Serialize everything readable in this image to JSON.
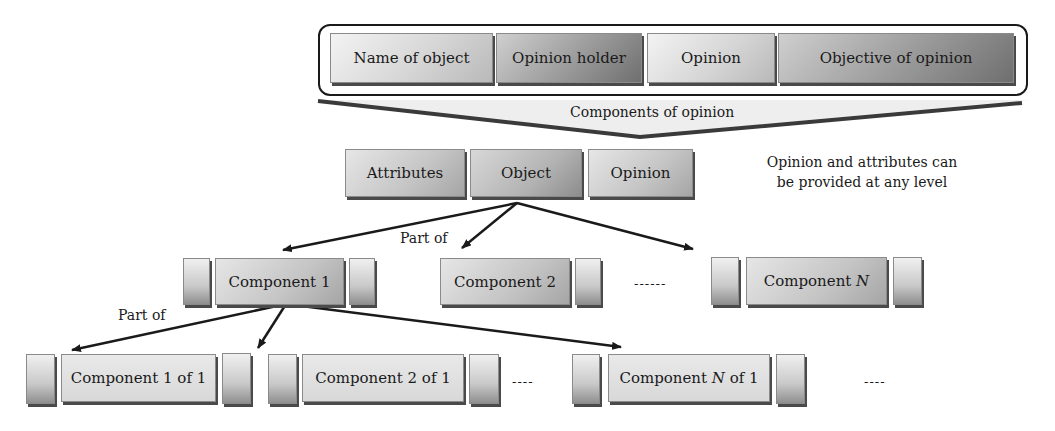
{
  "components_of_opinion": {
    "items": [
      {
        "label": "Name of object",
        "style": "light"
      },
      {
        "label": "Opinion holder",
        "style": "dark"
      },
      {
        "label": "Opinion",
        "style": "light"
      },
      {
        "label": "Objective of opinion",
        "style": "dark"
      }
    ],
    "caption": "Components of opinion"
  },
  "object_level": {
    "items": [
      "Attributes",
      "Object",
      "Opinion"
    ],
    "note_line1": "Opinion and attributes can",
    "note_line2": "be provided at any level"
  },
  "component_level": {
    "edge_label": "Part of",
    "items": [
      {
        "prefix": "Component 1",
        "italic": "",
        "suffix": ""
      },
      {
        "prefix": "Component 2",
        "italic": "",
        "suffix": ""
      },
      {
        "prefix": "Component ",
        "italic": "N",
        "suffix": ""
      }
    ],
    "ellipsis": "------"
  },
  "subcomponent_level": {
    "edge_label": "Part of",
    "items": [
      {
        "prefix": "Component 1 of 1",
        "italic": "",
        "suffix": ""
      },
      {
        "prefix": "Component 2 of 1",
        "italic": "",
        "suffix": ""
      },
      {
        "prefix": "Component ",
        "italic": "N",
        "suffix": " of 1"
      }
    ],
    "ellipsis": "----"
  }
}
